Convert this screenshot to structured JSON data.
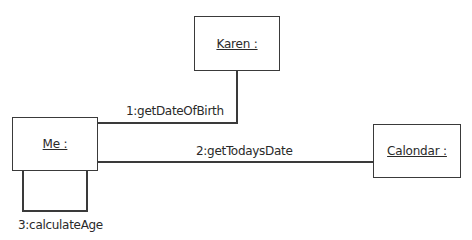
{
  "diagram": {
    "type": "uml-communication",
    "objects": [
      {
        "id": "karen",
        "label": "Karen :"
      },
      {
        "id": "me",
        "label": "Me :"
      },
      {
        "id": "calendar",
        "label": "Calondar :"
      }
    ],
    "messages": [
      {
        "from": "me",
        "to": "karen",
        "label": "1:getDateOfBirth"
      },
      {
        "from": "me",
        "to": "calendar",
        "label": "2:getTodaysDate"
      },
      {
        "from": "me",
        "to": "me",
        "label": "3:calculateAge"
      }
    ],
    "colors": {
      "line": "#3a3a3a",
      "text": "#2a2a2a",
      "background": "#ffffff"
    }
  }
}
